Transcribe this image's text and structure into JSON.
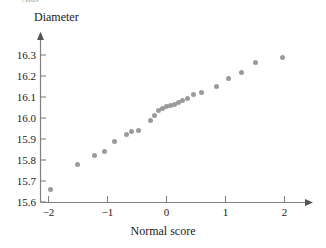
{
  "figure": {
    "clipped_header_text": "Aids",
    "marker_color": "#9a9a9a",
    "axis_color": "#808080",
    "text_color": "#1a1a1a"
  },
  "chart_data": {
    "type": "scatter",
    "title": "",
    "xlabel": "Normal score",
    "ylabel": "Diameter",
    "xlim": [
      -2.3,
      2.45
    ],
    "ylim": [
      15.6,
      16.35
    ],
    "grid": false,
    "legend": null,
    "xticks": [
      -2,
      -1,
      0,
      1,
      2
    ],
    "xtick_labels": [
      "−2",
      "−1",
      "0",
      "1",
      "2"
    ],
    "yticks": [
      15.6,
      15.7,
      15.8,
      15.9,
      16.0,
      16.1,
      16.2,
      16.3
    ],
    "ytick_labels": [
      "15.6",
      "15.7",
      "15.8",
      "15.9",
      "16.0",
      "16.1",
      "16.2",
      "16.3"
    ],
    "x": [
      -1.96,
      -1.51,
      -1.22,
      -1.05,
      -0.88,
      -0.68,
      -0.59,
      -0.48,
      -0.27,
      -0.21,
      -0.13,
      -0.06,
      0.0,
      0.06,
      0.13,
      0.21,
      0.27,
      0.36,
      0.45,
      0.59,
      0.84,
      1.05,
      1.27,
      1.51,
      1.96
    ],
    "y": [
      15.66,
      15.78,
      15.82,
      15.84,
      15.89,
      15.92,
      15.935,
      15.94,
      15.99,
      16.01,
      16.035,
      16.045,
      16.055,
      16.06,
      16.065,
      16.075,
      16.085,
      16.095,
      16.11,
      16.12,
      16.15,
      16.19,
      16.215,
      16.265,
      16.29
    ]
  }
}
